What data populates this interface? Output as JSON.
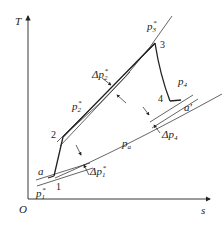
{
  "diagram": {
    "type": "T-s diagram (gas turbine cycle with pressure losses)",
    "axes": {
      "y_label": "T",
      "x_label": "s",
      "origin_label": "O"
    },
    "points": [
      {
        "id": "1",
        "label": "1"
      },
      {
        "id": "2",
        "label": "2"
      },
      {
        "id": "3",
        "label": "3"
      },
      {
        "id": "4",
        "label": "4"
      },
      {
        "id": "a",
        "label": "a"
      },
      {
        "id": "a_prime",
        "label": "a′"
      }
    ],
    "isobars": [
      {
        "id": "p1",
        "base": "p",
        "sub": "1",
        "sup": "*"
      },
      {
        "id": "p2",
        "base": "p",
        "sub": "2",
        "sup": "*"
      },
      {
        "id": "p3",
        "base": "p",
        "sub": "3",
        "sup": "*"
      },
      {
        "id": "p4",
        "base": "p",
        "sub": "4",
        "sup": ""
      },
      {
        "id": "pa",
        "base": "p",
        "sub": "a",
        "sup": ""
      }
    ],
    "pressure_losses": [
      {
        "id": "dp1",
        "prefix": "Δ",
        "base": "p",
        "sub": "1",
        "sup": "*"
      },
      {
        "id": "dp2",
        "prefix": "Δ",
        "base": "p",
        "sub": "2",
        "sup": "*"
      },
      {
        "id": "dp4",
        "prefix": "Δ",
        "base": "p",
        "sub": "4",
        "sup": ""
      }
    ],
    "colors": {
      "line": "#222222",
      "background": "#ffffff"
    }
  }
}
